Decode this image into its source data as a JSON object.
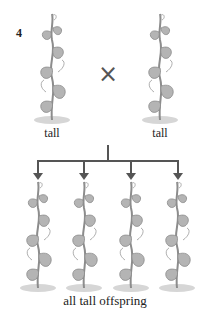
{
  "figure_number": "4",
  "parents": [
    {
      "label": "tall"
    },
    {
      "label": "tall"
    }
  ],
  "cross_symbol": "×",
  "offspring": [
    {
      "label": ""
    },
    {
      "label": ""
    },
    {
      "label": ""
    },
    {
      "label": ""
    }
  ],
  "offspring_caption": "all tall offspring",
  "colors": {
    "line": "#555555",
    "plant": "#9a9a9a"
  }
}
